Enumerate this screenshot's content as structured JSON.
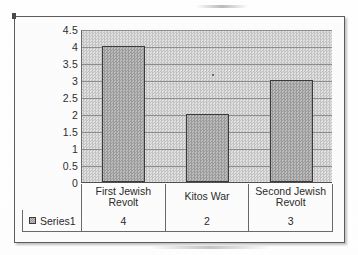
{
  "chart_data": {
    "type": "bar",
    "title": "",
    "xlabel": "",
    "ylabel": "",
    "categories": [
      "First Jewish Revolt",
      "Kitos War",
      "Second Jewish Revolt"
    ],
    "values": [
      4,
      2,
      3
    ],
    "series": [
      {
        "name": "Series1",
        "values": [
          4,
          2,
          3
        ]
      }
    ],
    "ylim": [
      0,
      4.5
    ],
    "ytick_labels": [
      "4.5",
      "4",
      "3.5",
      "3",
      "2.5",
      "2",
      "1.5",
      "1",
      "0.5",
      "0"
    ],
    "ytick_values": [
      4.5,
      4,
      3.5,
      3,
      2.5,
      2,
      1.5,
      1,
      0.5,
      0
    ],
    "grid": true,
    "legend_position": "bottom-table",
    "data_table": {
      "row_label": "Series1",
      "row_values": [
        "4",
        "2",
        "3"
      ]
    },
    "colors": {
      "bar_fill": "#a9a9a9",
      "bar_border": "#3b3b3b",
      "plot_background": "#cfcfcf",
      "gridline": "#8d8d8d",
      "text": "#2b2b2b",
      "frame_border": "#5d5d5d"
    }
  },
  "legend": {
    "swatch_name": "series1-swatch",
    "label": "Series1"
  }
}
